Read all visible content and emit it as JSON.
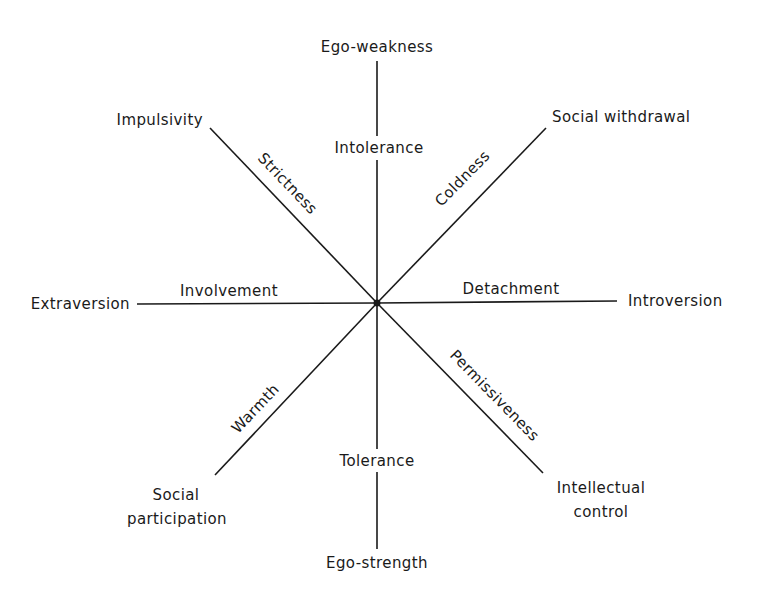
{
  "diagram": {
    "center": {
      "x": 377,
      "y": 303
    },
    "line_color": "#1a1a1a",
    "text_color": "#1a1a1a",
    "background": "#ffffff",
    "pole_labels": {
      "top": "Ego-weakness",
      "bottom": "Ego-strength",
      "left": "Extraversion",
      "right": "Introversion",
      "top_left": "Impulsivity",
      "top_right": "Social withdrawal",
      "bottom_left_line1": "Social",
      "bottom_left_line2": "participation",
      "bottom_right_line1": "Intellectual",
      "bottom_right_line2": "control"
    },
    "axis_labels": {
      "up": "Intolerance",
      "down": "Tolerance",
      "left": "Involvement",
      "right": "Detachment",
      "up_left": "Strictness",
      "up_right": "Coldness",
      "down_left": "Warmth",
      "down_right": "Permissiveness"
    }
  }
}
